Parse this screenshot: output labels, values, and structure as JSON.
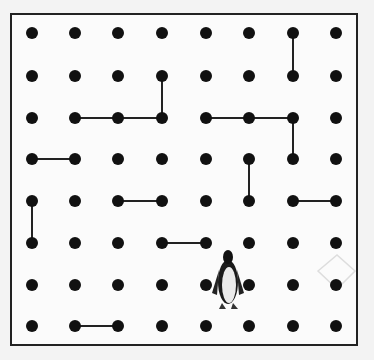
{
  "game": {
    "name": "Dots and Boxes",
    "grid": {
      "cols": 8,
      "rows": 8
    },
    "dot_x": [
      32,
      75,
      118,
      162,
      206,
      249,
      293,
      336
    ],
    "dot_y": [
      33,
      76,
      118,
      159,
      201,
      243,
      285,
      326
    ],
    "dot_color": "#111111",
    "line_color": "#222222",
    "lines": [
      {
        "from": [
          6,
          0
        ],
        "to": [
          6,
          1
        ]
      },
      {
        "from": [
          3,
          1
        ],
        "to": [
          3,
          2
        ]
      },
      {
        "from": [
          1,
          2
        ],
        "to": [
          2,
          2
        ]
      },
      {
        "from": [
          2,
          2
        ],
        "to": [
          3,
          2
        ]
      },
      {
        "from": [
          4,
          2
        ],
        "to": [
          5,
          2
        ]
      },
      {
        "from": [
          5,
          2
        ],
        "to": [
          6,
          2
        ]
      },
      {
        "from": [
          6,
          2
        ],
        "to": [
          6,
          3
        ]
      },
      {
        "from": [
          0,
          3
        ],
        "to": [
          1,
          3
        ]
      },
      {
        "from": [
          5,
          3
        ],
        "to": [
          5,
          4
        ]
      },
      {
        "from": [
          0,
          4
        ],
        "to": [
          0,
          5
        ]
      },
      {
        "from": [
          2,
          4
        ],
        "to": [
          3,
          4
        ]
      },
      {
        "from": [
          6,
          4
        ],
        "to": [
          7,
          4
        ]
      },
      {
        "from": [
          3,
          5
        ],
        "to": [
          4,
          5
        ]
      },
      {
        "from": [
          1,
          7
        ],
        "to": [
          2,
          7
        ]
      }
    ],
    "player": {
      "sprite": "penguin",
      "x": 228,
      "y": 285
    }
  }
}
